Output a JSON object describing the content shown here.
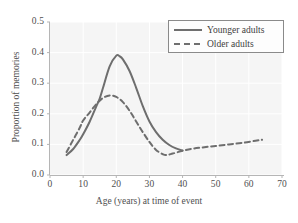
{
  "chart_data": {
    "type": "line",
    "title": "",
    "xlabel": "Age (years) at time of event",
    "ylabel": "Proportion of memories",
    "xlim": [
      0,
      70
    ],
    "ylim": [
      0.0,
      0.5
    ],
    "xticks": [
      "0",
      "10",
      "20",
      "30",
      "40",
      "50",
      "60",
      "70"
    ],
    "xtick_values": [
      0,
      10,
      20,
      30,
      40,
      50,
      60,
      70
    ],
    "yticks": [
      "0.0",
      "0.1",
      "0.2",
      "0.3",
      "0.4",
      "0.5"
    ],
    "ytick_values": [
      0.0,
      0.1,
      0.2,
      0.3,
      0.4,
      0.5
    ],
    "grid": true,
    "legend_position": "top-right",
    "series": [
      {
        "name": "Younger adults",
        "style": "solid",
        "color": "#6e6e6e",
        "x": [
          5,
          7,
          9,
          10,
          12,
          14,
          15,
          16,
          18,
          20,
          21,
          22,
          24,
          26,
          28,
          30,
          32,
          34,
          36,
          38,
          40
        ],
        "y": [
          0.065,
          0.085,
          0.115,
          0.133,
          0.175,
          0.225,
          0.25,
          0.285,
          0.355,
          0.39,
          0.388,
          0.378,
          0.34,
          0.285,
          0.225,
          0.175,
          0.14,
          0.115,
          0.098,
          0.087,
          0.08
        ]
      },
      {
        "name": "Older adults",
        "style": "dashed",
        "color": "#6e6e6e",
        "x": [
          5,
          7,
          9,
          10,
          12,
          14,
          16,
          18,
          20,
          22,
          24,
          26,
          28,
          30,
          32,
          34,
          35,
          37,
          40,
          43,
          46,
          50,
          54,
          58,
          62,
          64
        ],
        "y": [
          0.075,
          0.115,
          0.155,
          0.178,
          0.205,
          0.232,
          0.252,
          0.26,
          0.255,
          0.238,
          0.21,
          0.175,
          0.14,
          0.108,
          0.082,
          0.068,
          0.065,
          0.07,
          0.079,
          0.086,
          0.09,
          0.095,
          0.1,
          0.105,
          0.112,
          0.115
        ]
      }
    ]
  },
  "legend": {
    "entries": [
      {
        "label": "Younger adults"
      },
      {
        "label": "Older adults"
      }
    ]
  },
  "colors": {
    "line": "#6e6e6e",
    "plot_background": "#f5f5f5",
    "gridline": "#ffffff",
    "axis": "#b5b5b5",
    "text": "#4f4f4f"
  }
}
